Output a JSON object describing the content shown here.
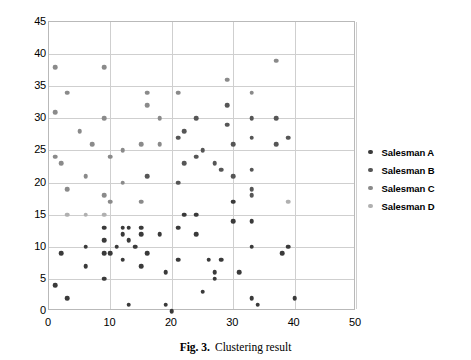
{
  "caption": {
    "label": "Fig. 3.",
    "text": "Clustering result"
  },
  "legend": {
    "position": "right",
    "entries": [
      {
        "label": "Salesman A",
        "color": "#3a3a3a"
      },
      {
        "label": "Salesman B",
        "color": "#565656"
      },
      {
        "label": "Salesman C",
        "color": "#8a8a8a"
      },
      {
        "label": "Salesman D",
        "color": "#b0b0b0"
      }
    ]
  },
  "chart_data": {
    "type": "scatter",
    "title": "",
    "xlabel": "",
    "ylabel": "",
    "xlim": [
      0,
      50
    ],
    "ylim": [
      0,
      45
    ],
    "xticks": [
      0,
      10,
      20,
      30,
      40,
      50
    ],
    "yticks": [
      0,
      5,
      10,
      15,
      20,
      25,
      30,
      35,
      40,
      45
    ],
    "grid": true,
    "legend_position": "right",
    "series": [
      {
        "name": "Salesman A",
        "color": "#3a3a3a",
        "points": [
          [
            1,
            4
          ],
          [
            2,
            9
          ],
          [
            3,
            2
          ],
          [
            6,
            7
          ],
          [
            6,
            10
          ],
          [
            9,
            5
          ],
          [
            9,
            9
          ],
          [
            9,
            11
          ],
          [
            9,
            13
          ],
          [
            10,
            9
          ],
          [
            11,
            10
          ],
          [
            12,
            8
          ],
          [
            12,
            12
          ],
          [
            12,
            13
          ],
          [
            13,
            1
          ],
          [
            13,
            11
          ],
          [
            13,
            13
          ],
          [
            14,
            10
          ],
          [
            15,
            7
          ],
          [
            15,
            12
          ],
          [
            15,
            13
          ],
          [
            16,
            9
          ],
          [
            18,
            12
          ],
          [
            19,
            1
          ],
          [
            19,
            6
          ],
          [
            20,
            0
          ],
          [
            21,
            8
          ],
          [
            21,
            13
          ],
          [
            22,
            15
          ],
          [
            24,
            12
          ],
          [
            24,
            15
          ],
          [
            25,
            3
          ],
          [
            26,
            8
          ],
          [
            27,
            5
          ],
          [
            27,
            6
          ],
          [
            28,
            8
          ],
          [
            30,
            14
          ],
          [
            30,
            17
          ],
          [
            31,
            6
          ],
          [
            33,
            2
          ],
          [
            33,
            10
          ],
          [
            33,
            14
          ],
          [
            34,
            1
          ],
          [
            38,
            9
          ],
          [
            39,
            10
          ],
          [
            40,
            2
          ]
        ]
      },
      {
        "name": "Salesman B",
        "color": "#565656",
        "points": [
          [
            16,
            21
          ],
          [
            21,
            20
          ],
          [
            21,
            27
          ],
          [
            22,
            23
          ],
          [
            22,
            28
          ],
          [
            24,
            24
          ],
          [
            24,
            30
          ],
          [
            25,
            25
          ],
          [
            27,
            23
          ],
          [
            28,
            22
          ],
          [
            29,
            29
          ],
          [
            29,
            32
          ],
          [
            30,
            21
          ],
          [
            30,
            26
          ],
          [
            33,
            18
          ],
          [
            33,
            19
          ],
          [
            33,
            22
          ],
          [
            33,
            27
          ],
          [
            33,
            30
          ],
          [
            37,
            26
          ],
          [
            37,
            30
          ],
          [
            39,
            27
          ]
        ]
      },
      {
        "name": "Salesman C",
        "color": "#8a8a8a",
        "points": [
          [
            1,
            24
          ],
          [
            1,
            31
          ],
          [
            1,
            38
          ],
          [
            2,
            23
          ],
          [
            3,
            19
          ],
          [
            3,
            34
          ],
          [
            5,
            28
          ],
          [
            6,
            21
          ],
          [
            7,
            26
          ],
          [
            9,
            18
          ],
          [
            9,
            30
          ],
          [
            9,
            38
          ],
          [
            10,
            17
          ],
          [
            10,
            24
          ],
          [
            12,
            20
          ],
          [
            12,
            25
          ],
          [
            15,
            17
          ],
          [
            15,
            26
          ],
          [
            16,
            32
          ],
          [
            16,
            34
          ],
          [
            18,
            26
          ],
          [
            18,
            30
          ],
          [
            21,
            34
          ],
          [
            29,
            36
          ],
          [
            33,
            34
          ],
          [
            37,
            39
          ]
        ]
      },
      {
        "name": "Salesman D",
        "color": "#b0b0b0",
        "points": [
          [
            3,
            15
          ],
          [
            6,
            15
          ],
          [
            9,
            15
          ],
          [
            39,
            17
          ]
        ]
      }
    ]
  }
}
